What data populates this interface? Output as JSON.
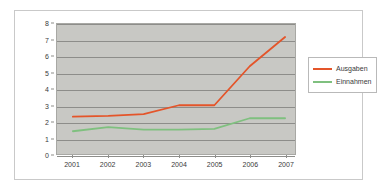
{
  "chart_data": {
    "type": "line",
    "title": "",
    "xlabel": "",
    "ylabel": "",
    "categories": [
      "2001",
      "2002",
      "2003",
      "2004",
      "2005",
      "2006",
      "2007"
    ],
    "series": [
      {
        "name": "Ausgaben",
        "color": "#e4552a",
        "values": [
          2.3,
          2.35,
          2.45,
          3.0,
          3.0,
          5.4,
          7.2
        ]
      },
      {
        "name": "Einnahmen",
        "color": "#7fc07f",
        "values": [
          1.4,
          1.65,
          1.5,
          1.5,
          1.55,
          2.2,
          2.2
        ]
      }
    ],
    "ylim": [
      0,
      8
    ],
    "y_ticks": [
      "0",
      "1",
      "2",
      "3",
      "4",
      "5",
      "6",
      "7",
      "8"
    ],
    "grid": true,
    "legend_position": "right",
    "plot_background": "#c8c8c4",
    "gridline_color": "#8d8d8a",
    "frame_border_color": "#c9c9c9"
  }
}
